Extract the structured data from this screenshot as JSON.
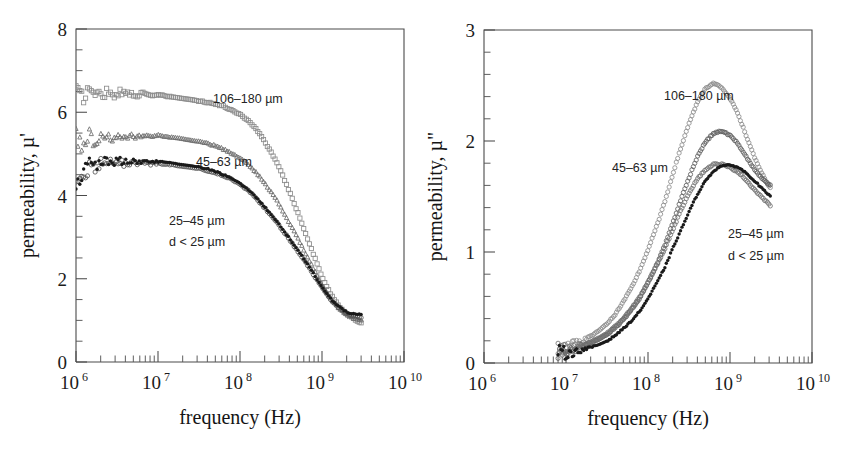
{
  "figure": {
    "background": "#ffffff",
    "panel_count": 2,
    "axis_color": "#4a4a4a"
  },
  "panels": [
    {
      "id": "left",
      "chart_data": {
        "type": "scatter",
        "title": "",
        "xlabel": "frequency (Hz)",
        "ylabel": "permeability, µ'",
        "xscale": "log",
        "xlim": [
          1000000,
          10000000000
        ],
        "ylim": [
          0,
          8
        ],
        "xticks": [
          1000000,
          10000000,
          100000000,
          1000000000,
          10000000000
        ],
        "xticklabels": [
          "10",
          "10",
          "10",
          "10",
          "10"
        ],
        "xtick_exponents": [
          "6",
          "7",
          "8",
          "9",
          "10"
        ],
        "yticks": [
          0,
          2,
          4,
          6,
          8
        ],
        "yticklabels": [
          "0",
          "2",
          "4",
          "6",
          "8"
        ],
        "yminor_step": 0.5,
        "grid": false,
        "legend": "inline-annotations",
        "annotations": [
          {
            "text": "106–180 µm",
            "x_px": 137,
            "y_px": 74
          },
          {
            "text": "45–63 µm",
            "x_px": 120,
            "y_px": 137
          },
          {
            "text": "25–45 µm",
            "x_px": 93,
            "y_px": 196
          },
          {
            "text": "d < 25 µm",
            "x_px": 93,
            "y_px": 217
          }
        ],
        "series": [
          {
            "name": "106–180 µm",
            "marker": "open-square",
            "color": "#8c8c8c",
            "x": [
              1000000.0,
              1150000.0,
              1300000.0,
              1500000.0,
              1700000.0,
              2000000.0,
              2400000.0,
              2800000.0,
              3300000.0,
              4000000.0,
              4700000.0,
              5600000.0,
              6600000.0,
              8000000.0,
              10000000.0,
              13000000.0,
              16000000.0,
              20000000.0,
              26000000.0,
              32000000.0,
              40000000.0,
              50000000.0,
              63000000.0,
              80000000.0,
              100000000.0,
              130000000.0,
              160000000.0,
              200000000.0,
              260000000.0,
              320000000.0,
              400000000.0,
              500000000.0,
              630000000.0,
              800000000.0,
              1000000000.0,
              1300000000.0,
              1600000000.0,
              2000000000.0,
              2500000000.0,
              3000000000.0
            ],
            "y": [
              6.55,
              6.32,
              6.45,
              6.6,
              6.38,
              6.45,
              6.5,
              6.42,
              6.48,
              6.45,
              6.46,
              6.42,
              6.44,
              6.4,
              6.42,
              6.38,
              6.36,
              6.33,
              6.3,
              6.27,
              6.24,
              6.2,
              6.14,
              6.05,
              5.95,
              5.78,
              5.58,
              5.3,
              4.92,
              4.55,
              4.1,
              3.62,
              3.1,
              2.55,
              2.05,
              1.6,
              1.35,
              1.15,
              1.02,
              0.95
            ]
          },
          {
            "name": "45–63 µm",
            "marker": "open-triangle",
            "color": "#6b6b6b",
            "x": [
              1000000.0,
              1150000.0,
              1300000.0,
              1500000.0,
              1700000.0,
              2000000.0,
              2400000.0,
              2800000.0,
              3300000.0,
              4000000.0,
              4700000.0,
              5600000.0,
              6600000.0,
              8000000.0,
              10000000.0,
              13000000.0,
              16000000.0,
              20000000.0,
              26000000.0,
              32000000.0,
              40000000.0,
              50000000.0,
              63000000.0,
              80000000.0,
              100000000.0,
              130000000.0,
              160000000.0,
              200000000.0,
              260000000.0,
              320000000.0,
              400000000.0,
              500000000.0,
              630000000.0,
              800000000.0,
              1000000000.0,
              1300000000.0,
              1600000000.0,
              2000000000.0,
              2500000000.0,
              3000000000.0
            ],
            "y": [
              5.5,
              5.2,
              5.35,
              5.45,
              5.3,
              5.38,
              5.45,
              5.4,
              5.48,
              5.44,
              5.47,
              5.42,
              5.45,
              5.43,
              5.45,
              5.42,
              5.4,
              5.37,
              5.33,
              5.3,
              5.26,
              5.2,
              5.12,
              5.02,
              4.9,
              4.73,
              4.55,
              4.3,
              4.0,
              3.7,
              3.35,
              3.0,
              2.62,
              2.22,
              1.85,
              1.5,
              1.3,
              1.15,
              1.05,
              1.0
            ]
          },
          {
            "name": "25–45 µm",
            "marker": "open-circle",
            "color": "#555555",
            "x": [
              1000000.0,
              1150000.0,
              1300000.0,
              1500000.0,
              1700000.0,
              2000000.0,
              2400000.0,
              2800000.0,
              3300000.0,
              4000000.0,
              4700000.0,
              5600000.0,
              6600000.0,
              8000000.0,
              10000000.0,
              13000000.0,
              16000000.0,
              20000000.0,
              26000000.0,
              32000000.0,
              40000000.0,
              50000000.0,
              63000000.0,
              80000000.0,
              100000000.0,
              130000000.0,
              160000000.0,
              200000000.0,
              260000000.0,
              320000000.0,
              400000000.0,
              500000000.0,
              630000000.0,
              800000000.0,
              1000000000.0,
              1300000000.0,
              1600000000.0,
              2000000000.0,
              2500000000.0,
              3000000000.0
            ],
            "y": [
              4.45,
              4.3,
              4.55,
              4.72,
              4.62,
              4.75,
              4.8,
              4.74,
              4.8,
              4.76,
              4.8,
              4.76,
              4.79,
              4.76,
              4.78,
              4.75,
              4.73,
              4.7,
              4.67,
              4.64,
              4.6,
              4.55,
              4.47,
              4.38,
              4.26,
              4.1,
              3.92,
              3.7,
              3.45,
              3.2,
              2.95,
              2.68,
              2.4,
              2.08,
              1.78,
              1.48,
              1.3,
              1.17,
              1.1,
              1.08
            ]
          },
          {
            "name": "d < 25 µm",
            "marker": "filled-diamond",
            "color": "#1a1a1a",
            "x": [
              1000000.0,
              1150000.0,
              1300000.0,
              1500000.0,
              1700000.0,
              2000000.0,
              2400000.0,
              2800000.0,
              3300000.0,
              4000000.0,
              4700000.0,
              5600000.0,
              6600000.0,
              8000000.0,
              10000000.0,
              13000000.0,
              16000000.0,
              20000000.0,
              26000000.0,
              32000000.0,
              40000000.0,
              50000000.0,
              63000000.0,
              80000000.0,
              100000000.0,
              130000000.0,
              160000000.0,
              200000000.0,
              260000000.0,
              320000000.0,
              400000000.0,
              500000000.0,
              630000000.0,
              800000000.0,
              1000000000.0,
              1300000000.0,
              1600000000.0,
              2000000000.0,
              2500000000.0,
              3000000000.0
            ],
            "y": [
              4.3,
              4.45,
              4.6,
              4.78,
              4.68,
              4.8,
              4.85,
              4.78,
              4.84,
              4.8,
              4.84,
              4.8,
              4.83,
              4.8,
              4.82,
              4.79,
              4.77,
              4.74,
              4.71,
              4.68,
              4.64,
              4.58,
              4.5,
              4.4,
              4.28,
              4.12,
              3.94,
              3.72,
              3.47,
              3.22,
              2.97,
              2.7,
              2.42,
              2.1,
              1.8,
              1.5,
              1.33,
              1.2,
              1.15,
              1.15
            ]
          }
        ]
      }
    },
    {
      "id": "right",
      "chart_data": {
        "type": "scatter",
        "title": "",
        "xlabel": "frequency (Hz)",
        "ylabel": "permeability, µ\"",
        "xscale": "log",
        "xlim": [
          1000000,
          10000000000
        ],
        "ylim": [
          0,
          3
        ],
        "xticks": [
          1000000,
          10000000,
          100000000,
          1000000000,
          10000000000
        ],
        "xticklabels": [
          "10",
          "10",
          "10",
          "10",
          "10"
        ],
        "xtick_exponents": [
          "6",
          "7",
          "8",
          "9",
          "10"
        ],
        "yticks": [
          0,
          1,
          2,
          3
        ],
        "yticklabels": [
          "0",
          "1",
          "2",
          "3"
        ],
        "yminor_step": 0.2,
        "grid": false,
        "legend": "inline-annotations",
        "annotations": [
          {
            "text": "106–180 µm",
            "x_px": 180,
            "y_px": 70
          },
          {
            "text": "45–63 µm",
            "x_px": 128,
            "y_px": 142
          },
          {
            "text": "25–45 µm",
            "x_px": 244,
            "y_px": 208
          },
          {
            "text": "d < 25 µm",
            "x_px": 244,
            "y_px": 230
          }
        ],
        "series": [
          {
            "name": "106–180 µm",
            "marker": "open-circle",
            "color": "#8c8c8c",
            "x": [
              8000000.0,
              10000000.0,
              13000000.0,
              16000000.0,
              20000000.0,
              26000000.0,
              32000000.0,
              40000000.0,
              50000000.0,
              63000000.0,
              80000000.0,
              100000000.0,
              130000000.0,
              160000000.0,
              200000000.0,
              260000000.0,
              320000000.0,
              400000000.0,
              500000000.0,
              630000000.0,
              800000000.0,
              1000000000.0,
              1200000000.0,
              1400000000.0,
              1700000000.0,
              2000000000.0,
              2400000000.0,
              2800000000.0,
              3100000000.0
            ],
            "y": [
              0.12,
              0.14,
              0.17,
              0.2,
              0.24,
              0.3,
              0.36,
              0.44,
              0.55,
              0.68,
              0.84,
              1.02,
              1.25,
              1.45,
              1.7,
              1.97,
              2.17,
              2.35,
              2.47,
              2.52,
              2.48,
              2.38,
              2.28,
              2.15,
              1.98,
              1.85,
              1.72,
              1.63,
              1.58
            ]
          },
          {
            "name": "45–63 µm",
            "marker": "open-circle",
            "color": "#5f5f5f",
            "x": [
              8000000.0,
              10000000.0,
              13000000.0,
              16000000.0,
              20000000.0,
              26000000.0,
              32000000.0,
              40000000.0,
              50000000.0,
              63000000.0,
              80000000.0,
              100000000.0,
              130000000.0,
              160000000.0,
              200000000.0,
              260000000.0,
              320000000.0,
              400000000.0,
              500000000.0,
              630000000.0,
              800000000.0,
              1000000000.0,
              1200000000.0,
              1400000000.0,
              1700000000.0,
              2000000000.0,
              2400000000.0,
              2800000000.0,
              3100000000.0
            ],
            "y": [
              0.1,
              0.11,
              0.13,
              0.15,
              0.18,
              0.22,
              0.26,
              0.32,
              0.39,
              0.48,
              0.59,
              0.72,
              0.9,
              1.06,
              1.26,
              1.5,
              1.68,
              1.86,
              1.99,
              2.07,
              2.09,
              2.05,
              1.99,
              1.92,
              1.82,
              1.74,
              1.67,
              1.62,
              1.6
            ]
          },
          {
            "name": "25–45 µm",
            "marker": "open-circle",
            "color": "#737373",
            "x": [
              8000000.0,
              10000000.0,
              13000000.0,
              16000000.0,
              20000000.0,
              26000000.0,
              32000000.0,
              40000000.0,
              50000000.0,
              63000000.0,
              80000000.0,
              100000000.0,
              130000000.0,
              160000000.0,
              200000000.0,
              260000000.0,
              320000000.0,
              400000000.0,
              500000000.0,
              630000000.0,
              800000000.0,
              1000000000.0,
              1200000000.0,
              1400000000.0,
              1700000000.0,
              2000000000.0,
              2400000000.0,
              2800000000.0,
              3100000000.0
            ],
            "y": [
              0.11,
              0.12,
              0.14,
              0.16,
              0.19,
              0.23,
              0.27,
              0.33,
              0.4,
              0.49,
              0.6,
              0.73,
              0.89,
              1.03,
              1.2,
              1.4,
              1.54,
              1.66,
              1.74,
              1.79,
              1.79,
              1.76,
              1.73,
              1.69,
              1.62,
              1.56,
              1.5,
              1.45,
              1.42
            ]
          },
          {
            "name": "d < 25 µm",
            "marker": "filled-diamond",
            "color": "#1a1a1a",
            "x": [
              8000000.0,
              10000000.0,
              13000000.0,
              16000000.0,
              20000000.0,
              26000000.0,
              32000000.0,
              40000000.0,
              50000000.0,
              63000000.0,
              80000000.0,
              100000000.0,
              130000000.0,
              160000000.0,
              200000000.0,
              260000000.0,
              320000000.0,
              400000000.0,
              500000000.0,
              630000000.0,
              800000000.0,
              1000000000.0,
              1200000000.0,
              1400000000.0,
              1700000000.0,
              2000000000.0,
              2400000000.0,
              2800000000.0,
              3100000000.0
            ],
            "y": [
              0.08,
              0.09,
              0.1,
              0.12,
              0.14,
              0.17,
              0.2,
              0.25,
              0.31,
              0.38,
              0.47,
              0.58,
              0.73,
              0.86,
              1.03,
              1.22,
              1.37,
              1.52,
              1.64,
              1.73,
              1.78,
              1.78,
              1.77,
              1.74,
              1.69,
              1.64,
              1.58,
              1.53,
              1.5
            ]
          }
        ]
      }
    }
  ]
}
